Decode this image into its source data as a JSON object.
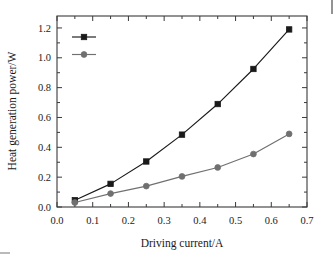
{
  "chart_data": {
    "type": "line",
    "title": "",
    "xlabel": "Driving current/A",
    "ylabel": "Heat generation power/W",
    "xlim": [
      0.0,
      0.7
    ],
    "ylim": [
      0.0,
      1.28
    ],
    "xticks": [
      "0.0",
      "0.1",
      "0.2",
      "0.3",
      "0.4",
      "0.5",
      "0.6",
      "0.7"
    ],
    "xtick_values": [
      0.0,
      0.1,
      0.2,
      0.3,
      0.4,
      0.5,
      0.6,
      0.7
    ],
    "yticks": [
      "0.0",
      "0.2",
      "0.4",
      "0.6",
      "0.8",
      "1.0",
      "1.2"
    ],
    "ytick_values": [
      0.0,
      0.2,
      0.4,
      0.6,
      0.8,
      1.0,
      1.2
    ],
    "grid": false,
    "legend_position": "upper left",
    "x": [
      0.05,
      0.15,
      0.25,
      0.35,
      0.45,
      0.55,
      0.65
    ],
    "series": [
      {
        "name": "P_heat-chip",
        "label_base": "P",
        "label_sub": "heat-chip",
        "marker": "square",
        "color": "#1a1a1a",
        "values": [
          0.045,
          0.155,
          0.305,
          0.485,
          0.69,
          0.925,
          1.19
        ]
      },
      {
        "name": "P_phosphor",
        "label_base": "P",
        "label_sub": "phosphor",
        "marker": "circle",
        "color": "#707070",
        "values": [
          0.03,
          0.09,
          0.14,
          0.205,
          0.265,
          0.355,
          0.49
        ]
      }
    ]
  },
  "figure": {
    "frame_color": "#3a3a3a",
    "background": "#ffffff",
    "axis_label_x": "Driving current/A",
    "axis_label_y": "Heat generation power/W"
  }
}
